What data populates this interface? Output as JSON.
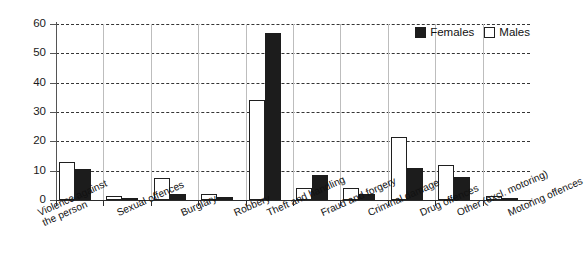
{
  "chart_data": {
    "type": "bar",
    "title": "",
    "subtitle": "",
    "xlabel": "",
    "ylabel": "",
    "ylim": [
      0,
      60
    ],
    "yticks": [
      0,
      10,
      20,
      30,
      40,
      50,
      60
    ],
    "grid": true,
    "legend_position": "top-right",
    "categories": [
      "Violence against\nthe person",
      "Sexual offences",
      "Burglary",
      "Robbery",
      "Theft and handling",
      "Fraud and forgery",
      "Criminal damage",
      "Drug offences",
      "Other (excl. motoring)",
      "Motoring offences"
    ],
    "series": [
      {
        "name": "Males",
        "color": "#ffffff",
        "edge_color": "#1f1f1f",
        "values": [
          13,
          1.5,
          7.5,
          2,
          34,
          4,
          4,
          21.5,
          12,
          1.5
        ]
      },
      {
        "name": "Females",
        "color": "#1c1c1c",
        "edge_color": "#1c1c1c",
        "values": [
          10.5,
          0.1,
          2,
          1,
          57,
          8.5,
          2,
          11,
          8,
          0.5
        ]
      }
    ]
  },
  "legend": {
    "entries": [
      {
        "label": "Females",
        "swatch": "filled-square-icon"
      },
      {
        "label": "Males",
        "swatch": "hollow-square-icon"
      }
    ]
  },
  "axis": {
    "y_tick_labels": [
      "0",
      "10",
      "20",
      "30",
      "40",
      "50",
      "60"
    ]
  }
}
